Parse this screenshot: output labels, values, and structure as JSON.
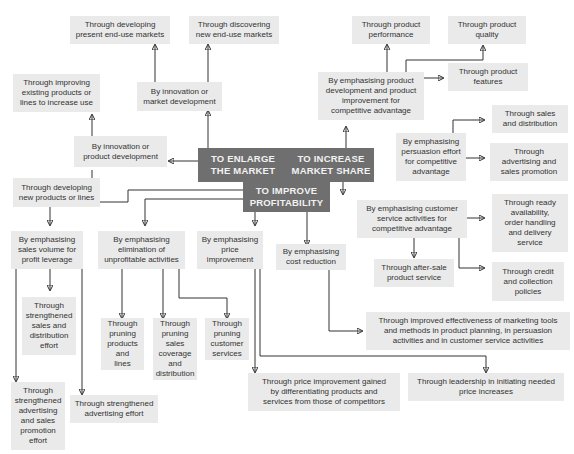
{
  "diagram": {
    "hubs": {
      "enlarge": "TO ENLARGE\nTHE MARKET",
      "increase": "TO INCREASE\nMARKET SHARE",
      "improve": "TO IMPROVE\nPROFITABILITY"
    },
    "enlarge_branch": {
      "product_dev": "By innovation or\nproduct development",
      "market_dev": "By innovation or\nmarket development",
      "present_markets": "Through developing\npresent end-use markets",
      "new_markets": "Through discovering\nnew end-use markets",
      "improving_existing": "Through improving\nexisting products or\nlines to increase use",
      "new_products": "Through developing\nnew products or lines"
    },
    "increase_branch": {
      "product_improvement": "By emphasising product\ndevelopment and product\nimprovement for\ncompetitive advantage",
      "performance": "Through product\nperformance",
      "quality": "Through product\nquality",
      "features": "Through product\nfeatures",
      "persuasion": "By emphasising\npersuasion effort\nfor competitive\nadvantage",
      "sales_distribution": "Through sales\nand distribution",
      "advertising": "Through\nadvertising and\nsales promotion",
      "customer_service": "By emphasising customer\nservice activities for\ncompetitive advantage",
      "ready_availability": "Through ready\navailability,\norder handling\nand delivery\nservice",
      "after_sale": "Through after-sale\nproduct service",
      "credit": "Through credit\nand collection\npolicies"
    },
    "improve_branch": {
      "sales_volume": "By emphasising\nsales volume for\nprofit leverage",
      "elimination": "By emphasising\nelimination of\nunprofitable activities",
      "price": "By emphasising\nprice\nimprovement",
      "cost": "By emphasising\ncost reduction",
      "strengthened_sales": "Through\nstrengthened\nsales and\ndistribution\neffort",
      "strengthened_adv_promo": "Through\nstrengthened\nadvertising\nand sales\npromotion\neffort",
      "strengthened_adv": "Through strengthened\nadvertising effort",
      "pruning_products": "Through\npruning\nproducts\nand\nlines",
      "pruning_coverage": "Through\npruning\nsales\ncoverage\nand\ndistribution",
      "pruning_services": "Through\npruning\ncustomer\nservices",
      "marketing_tools": "Through improved effectiveness of marketing tools\nand methods in product planning, in persuasion\nactivities and in customer service activities",
      "differentiating": "Through price improvement gained\nby differentiating products and\nservices from those of competitors",
      "leadership": "Through leadership in initiating needed\nprice increases"
    },
    "colors": {
      "hub": "#6f6f6f",
      "box": "#eaeaea",
      "line": "#333333"
    }
  }
}
